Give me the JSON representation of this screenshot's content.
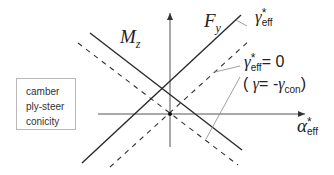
{
  "diagram": {
    "axes": {
      "x_label_main": "α",
      "x_label_sup": "*",
      "x_label_sub": "eff"
    },
    "curves": [
      {
        "name": "Fy",
        "label_main": "F",
        "label_sub": "y",
        "style": "solid"
      },
      {
        "name": "Mz",
        "label_main": "M",
        "label_sub": "z",
        "style": "solid"
      },
      {
        "name": "Fy_shifted",
        "style": "dashed"
      },
      {
        "name": "Mz_shifted",
        "style": "dashed"
      }
    ],
    "annotations": {
      "gamma_eff": {
        "main": "γ",
        "sup": "*",
        "sub": "eff"
      },
      "gamma_eff_zero": {
        "main": "γ",
        "sup": "*",
        "sub": "eff",
        "suffix": "= 0"
      },
      "gamma_con": {
        "open": "( ",
        "gamma": "γ",
        "eq": "= -",
        "gamma2": "γ",
        "sub": "con",
        "close": ")"
      }
    },
    "legend": {
      "items": [
        "camber",
        "ply-steer",
        "conicity"
      ]
    },
    "colors": {
      "line": "#2a2a2a",
      "axis": "#555555",
      "leader": "#888888",
      "legend_border": "#b8b8b8"
    }
  }
}
